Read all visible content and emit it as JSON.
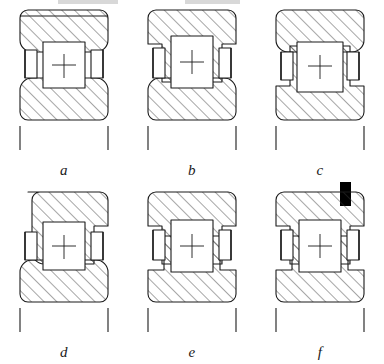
{
  "figure": {
    "type": "engineering-cross-section",
    "rows": 2,
    "columns": 3,
    "stroke_color": "#1a1a1a",
    "hatch_color": "#3a3a3a",
    "fill_color": "#ffffff",
    "accent_color": "#000000",
    "items": [
      {
        "id": "a",
        "label": "a",
        "outer_ring_ribs": "none",
        "inner_ring_ribs": "none",
        "snap_ring": false
      },
      {
        "id": "b",
        "label": "b",
        "outer_ring_ribs": "both",
        "inner_ring_ribs": "none",
        "snap_ring": false
      },
      {
        "id": "c",
        "label": "c",
        "outer_ring_ribs": "none",
        "inner_ring_ribs": "both",
        "snap_ring": false
      },
      {
        "id": "d",
        "label": "d",
        "outer_ring_ribs": "right",
        "inner_ring_ribs": "none",
        "snap_ring": false
      },
      {
        "id": "e",
        "label": "e",
        "outer_ring_ribs": "left",
        "inner_ring_ribs": "both",
        "snap_ring": false
      },
      {
        "id": "f",
        "label": "f",
        "outer_ring_ribs": "both",
        "inner_ring_ribs": "both",
        "snap_ring": true
      }
    ]
  }
}
